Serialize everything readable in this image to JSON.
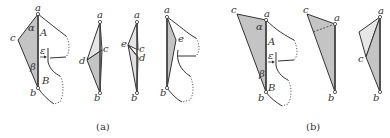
{
  "figure": {
    "colors": {
      "shade_dark": "#c4c4c4",
      "shade_light": "#e6e6e6",
      "stroke": "#333333",
      "background": "#ffffff"
    },
    "subfigure_a": {
      "caption": "(a)",
      "panel1": {
        "vertices": {
          "a": "a",
          "b": "b",
          "c": "c"
        },
        "angle_labels": {
          "alpha": "α",
          "beta": "β"
        },
        "region_labels": {
          "A": "A",
          "B": "B"
        },
        "epsilon": "ε"
      },
      "panel2": {
        "vertices": {
          "a": "a",
          "b": "b",
          "c": "c",
          "d": "d"
        }
      },
      "panel3": {
        "vertices": {
          "a": "a",
          "b": "b",
          "c": "c",
          "d": "d",
          "e": "e"
        }
      },
      "panel4": {
        "vertices": {
          "a": "a",
          "b": "b",
          "e": "e"
        }
      }
    },
    "subfigure_b": {
      "caption": "(b)",
      "panel1": {
        "vertices": {
          "a": "a",
          "b": "b",
          "c": "c"
        },
        "angle_labels": {
          "alpha": "α",
          "beta": "β"
        },
        "region_labels": {
          "A": "A",
          "B": "B"
        },
        "epsilon": "ε"
      },
      "panel2": {
        "vertices": {
          "a": "a",
          "b": "b",
          "c": "c"
        }
      },
      "panel3": {
        "vertices": {
          "a": "a",
          "b": "b",
          "c": "c"
        }
      }
    }
  }
}
